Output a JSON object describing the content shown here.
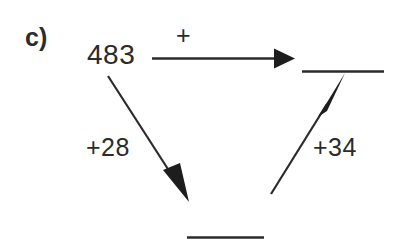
{
  "problem": {
    "part_label": "c)",
    "start_number": "483",
    "top_operation": "+",
    "left_operation": "+28",
    "right_operation": "+34",
    "answer_blank_top_right": "",
    "answer_blank_bottom": ""
  },
  "style": {
    "ink_color": "#2b2b2b",
    "background_color": "#ffffff"
  },
  "icons": {
    "arrow_right": "arrow-right-icon",
    "arrow_down_right": "arrow-down-right-icon",
    "arrow_up_right": "arrow-up-right-icon"
  }
}
